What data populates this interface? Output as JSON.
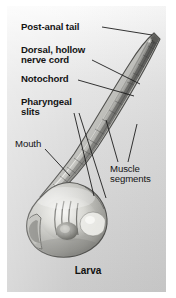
{
  "figure": {
    "caption": "Larva",
    "background_color": "#d8d8d8",
    "text_color": "#141414"
  },
  "labels": [
    {
      "id": "post_anal_tail",
      "text": "Post-anal tail",
      "weight": "bold"
    },
    {
      "id": "dorsal_nerve_cord",
      "text": "Dorsal, hollow\nnerve cord",
      "weight": "bold"
    },
    {
      "id": "notochord",
      "text": "Notochord",
      "weight": "bold"
    },
    {
      "id": "pharyngeal_slits",
      "text": "Pharyngeal\nslits",
      "weight": "bold"
    },
    {
      "id": "mouth",
      "text": "Mouth",
      "weight": "regular"
    },
    {
      "id": "muscle_segments",
      "text": "Muscle\nsegments",
      "weight": "regular"
    }
  ],
  "label_text": {
    "post_anal_tail": "Post-anal tail",
    "dorsal_nerve_cord": "Dorsal, hollow\nnerve cord",
    "notochord": "Notochord",
    "pharyngeal_slits": "Pharyngeal\nslits",
    "mouth": "Mouth",
    "muscle_segments": "Muscle\nsegments"
  }
}
